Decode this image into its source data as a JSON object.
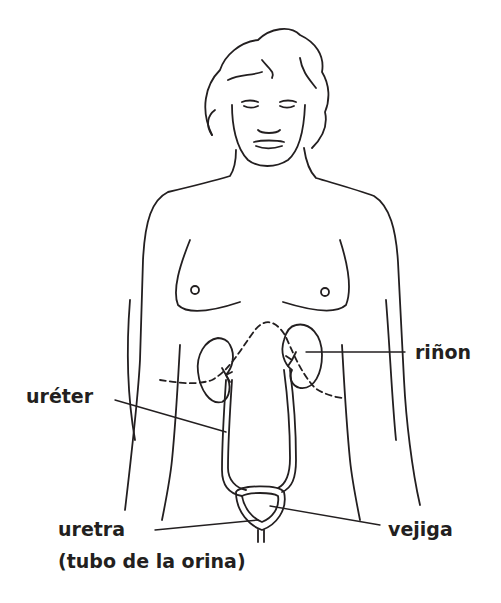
{
  "diagram": {
    "labels": {
      "kidney": "riñon",
      "ureter": "uréter",
      "urethra": "uretra",
      "urethra_note": "(tubo de la orina)",
      "bladder": "vejiga"
    },
    "colors": {
      "line": "#231f20",
      "background": "#ffffff"
    }
  }
}
